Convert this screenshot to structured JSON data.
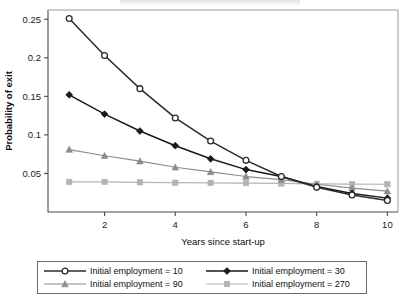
{
  "chart_data": {
    "type": "line",
    "title": "",
    "xlabel": "Years since start-up",
    "ylabel": "Probability of exit",
    "x": [
      1,
      2,
      3,
      4,
      5,
      6,
      7,
      8,
      9,
      10
    ],
    "xlim": [
      0.4,
      10.3
    ],
    "ylim": [
      0.0,
      0.262
    ],
    "xticks": [
      2,
      4,
      6,
      8,
      10
    ],
    "xticklabels": [
      "2",
      "4",
      "6",
      "8",
      "10"
    ],
    "yticks": [
      0.05,
      0.1,
      0.15,
      0.2,
      0.25
    ],
    "yticklabels": [
      "0.05",
      "0.1",
      "0.15",
      "0.2",
      "0.25"
    ],
    "grid": false,
    "legend_position": "below-outside",
    "series": [
      {
        "name": "Initial employment = 10",
        "marker": "open-circle",
        "color": "#2b2b2b",
        "values": [
          0.251,
          0.203,
          0.16,
          0.122,
          0.092,
          0.067,
          0.046,
          0.032,
          0.022,
          0.015
        ]
      },
      {
        "name": "Initial employment = 30",
        "marker": "filled-diamond",
        "color": "#1a1a1a",
        "values": [
          0.152,
          0.127,
          0.105,
          0.086,
          0.069,
          0.055,
          0.046,
          0.033,
          0.024,
          0.018
        ]
      },
      {
        "name": "Initial employment = 90",
        "marker": "filled-triangle",
        "color": "#8c8c8c",
        "values": [
          0.081,
          0.073,
          0.066,
          0.058,
          0.052,
          0.046,
          0.042,
          0.036,
          0.031,
          0.027
        ]
      },
      {
        "name": "Initial employment = 270",
        "marker": "filled-square",
        "color": "#b3b3b3",
        "values": [
          0.039,
          0.039,
          0.0385,
          0.038,
          0.0378,
          0.0375,
          0.037,
          0.0365,
          0.0362,
          0.036
        ]
      }
    ]
  },
  "axes": {
    "y_title": "Probability of exit",
    "x_title": "Years since start-up"
  },
  "legend": {
    "entries": [
      {
        "label": "Initial employment = 10",
        "marker": "open-circle",
        "color": "#2b2b2b"
      },
      {
        "label": "Initial employment = 30",
        "marker": "filled-diamond",
        "color": "#1a1a1a"
      },
      {
        "label": "Initial employment = 90",
        "marker": "filled-triangle",
        "color": "#8c8c8c"
      },
      {
        "label": "Initial employment = 270",
        "marker": "filled-square",
        "color": "#b3b3b3"
      }
    ]
  }
}
